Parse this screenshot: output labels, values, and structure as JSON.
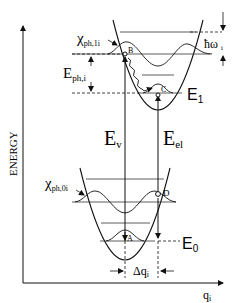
{
  "diagram": {
    "axes": {
      "y_label": "ENERGY",
      "x_label": "q",
      "x_label_sub": "i"
    },
    "upper_state": {
      "wavefunction_label": "χ",
      "wavefunction_sub": "ph,1i",
      "energy_label": "E",
      "energy_sub": "1",
      "phonon_energy_label": "E",
      "phonon_energy_sub": "ph,i",
      "quantum_label": "ħω",
      "quantum_sub": "i"
    },
    "lower_state": {
      "wavefunction_label": "χ",
      "wavefunction_sub": "ph,0i",
      "energy_label": "E",
      "energy_sub": "0"
    },
    "transitions": {
      "vertical_label": "E",
      "vertical_sub": "v",
      "electronic_label": "E",
      "electronic_sub": "el"
    },
    "points": {
      "A": "A",
      "B": "B",
      "C": "C",
      "D": "D"
    },
    "displacement_label": "Δq",
    "displacement_sub": "i"
  }
}
